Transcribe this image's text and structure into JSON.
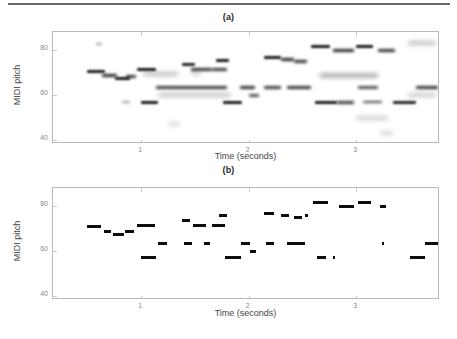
{
  "figure": {
    "background_color": "#ffffff",
    "rule_color": "#6b6b6b",
    "axis_color": "#b9b9b9",
    "ink_color": "#0d0d0d"
  },
  "panels": [
    {
      "id": "panel-a",
      "title": "(a)",
      "xlabel": "Time (seconds)",
      "ylabel": "MIDI pitch",
      "xticks": [
        1,
        2,
        3
      ],
      "xtick_labels": [
        "1",
        "2",
        "3"
      ],
      "yticks": [
        40,
        60,
        80
      ],
      "ytick_labels": [
        "40",
        "60",
        "80"
      ]
    },
    {
      "id": "panel-b",
      "title": "(b)",
      "xlabel": "Time (seconds)",
      "ylabel": "MIDI pitch",
      "xticks": [
        1,
        2,
        3
      ],
      "xtick_labels": [
        "1",
        "2",
        "3"
      ],
      "yticks": [
        40,
        60,
        80
      ],
      "ytick_labels": [
        "40",
        "60",
        "80"
      ]
    }
  ],
  "chart_data": [
    {
      "type": "heatmap",
      "id": "panel-a",
      "title": "(a)",
      "xlabel": "Time (seconds)",
      "ylabel": "MIDI pitch",
      "xlim": [
        0.18,
        3.78
      ],
      "ylim": [
        38.0,
        88.0
      ],
      "xticks": [
        1,
        2,
        3
      ],
      "yticks": [
        40,
        60,
        80
      ],
      "grid": false,
      "legend": "none",
      "description": "Blurred pitch-salience representation: smeared horizontal energy traces at the note pitches of panel (b), with faint partials and spurious low-level energy.",
      "traces": [
        {
          "t0": 0.5,
          "t1": 0.66,
          "pitch": 70.6,
          "strength": 0.95,
          "blur": 1
        },
        {
          "t0": 0.64,
          "t1": 0.78,
          "pitch": 68.6,
          "strength": 0.9,
          "blur": 2
        },
        {
          "t0": 0.76,
          "t1": 0.9,
          "pitch": 67.4,
          "strength": 0.95,
          "blur": 1
        },
        {
          "t0": 0.86,
          "t1": 0.95,
          "pitch": 68.4,
          "strength": 0.85,
          "blur": 2
        },
        {
          "t0": 0.96,
          "t1": 1.14,
          "pitch": 71.4,
          "strength": 0.95,
          "blur": 1
        },
        {
          "t0": 1.02,
          "t1": 1.34,
          "pitch": 69.3,
          "strength": 0.45,
          "blur": 3
        },
        {
          "t0": 1.14,
          "t1": 1.8,
          "pitch": 63.4,
          "strength": 0.8,
          "blur": 2
        },
        {
          "t0": 1.16,
          "t1": 1.84,
          "pitch": 59.9,
          "strength": 0.4,
          "blur": 3
        },
        {
          "t0": 1.0,
          "t1": 1.16,
          "pitch": 56.8,
          "strength": 0.95,
          "blur": 1
        },
        {
          "t0": 1.38,
          "t1": 1.5,
          "pitch": 73.5,
          "strength": 0.9,
          "blur": 1
        },
        {
          "t0": 1.46,
          "t1": 1.66,
          "pitch": 71.3,
          "strength": 0.85,
          "blur": 2
        },
        {
          "t0": 1.7,
          "t1": 1.82,
          "pitch": 75.6,
          "strength": 0.95,
          "blur": 1
        },
        {
          "t0": 1.66,
          "t1": 1.8,
          "pitch": 71.3,
          "strength": 0.8,
          "blur": 2
        },
        {
          "t0": 1.76,
          "t1": 1.94,
          "pitch": 56.8,
          "strength": 0.95,
          "blur": 1
        },
        {
          "t0": 1.92,
          "t1": 2.06,
          "pitch": 63.4,
          "strength": 0.85,
          "blur": 2
        },
        {
          "t0": 2.0,
          "t1": 2.1,
          "pitch": 59.8,
          "strength": 0.7,
          "blur": 2
        },
        {
          "t0": 2.14,
          "t1": 2.3,
          "pitch": 76.8,
          "strength": 0.95,
          "blur": 1
        },
        {
          "t0": 2.14,
          "t1": 2.3,
          "pitch": 63.4,
          "strength": 0.8,
          "blur": 2
        },
        {
          "t0": 2.3,
          "t1": 2.42,
          "pitch": 75.8,
          "strength": 0.9,
          "blur": 2
        },
        {
          "t0": 2.36,
          "t1": 2.58,
          "pitch": 63.4,
          "strength": 0.85,
          "blur": 2
        },
        {
          "t0": 2.42,
          "t1": 2.54,
          "pitch": 75.0,
          "strength": 0.85,
          "blur": 2
        },
        {
          "t0": 2.58,
          "t1": 2.76,
          "pitch": 81.6,
          "strength": 0.95,
          "blur": 1
        },
        {
          "t0": 2.62,
          "t1": 2.82,
          "pitch": 56.8,
          "strength": 0.95,
          "blur": 1
        },
        {
          "t0": 2.66,
          "t1": 3.2,
          "pitch": 68.6,
          "strength": 0.45,
          "blur": 3
        },
        {
          "t0": 2.78,
          "t1": 2.98,
          "pitch": 79.7,
          "strength": 0.9,
          "blur": 2
        },
        {
          "t0": 2.82,
          "t1": 2.98,
          "pitch": 56.8,
          "strength": 0.8,
          "blur": 2
        },
        {
          "t0": 3.0,
          "t1": 3.16,
          "pitch": 81.6,
          "strength": 0.95,
          "blur": 1
        },
        {
          "t0": 3.02,
          "t1": 3.2,
          "pitch": 63.4,
          "strength": 0.7,
          "blur": 2
        },
        {
          "t0": 3.06,
          "t1": 3.24,
          "pitch": 56.8,
          "strength": 0.75,
          "blur": 2
        },
        {
          "t0": 3.2,
          "t1": 3.36,
          "pitch": 79.7,
          "strength": 0.85,
          "blur": 2
        },
        {
          "t0": 3.34,
          "t1": 3.56,
          "pitch": 56.8,
          "strength": 0.9,
          "blur": 1
        },
        {
          "t0": 3.48,
          "t1": 3.74,
          "pitch": 83.0,
          "strength": 0.45,
          "blur": 3
        },
        {
          "t0": 3.56,
          "t1": 3.76,
          "pitch": 63.4,
          "strength": 0.85,
          "blur": 2
        },
        {
          "t0": 3.48,
          "t1": 3.74,
          "pitch": 59.9,
          "strength": 0.35,
          "blur": 3
        },
        {
          "t0": 3.0,
          "t1": 3.3,
          "pitch": 49.5,
          "strength": 0.25,
          "blur": 3
        },
        {
          "t0": 0.58,
          "t1": 0.64,
          "pitch": 82.5,
          "strength": 0.3,
          "blur": 2
        },
        {
          "t0": 0.82,
          "t1": 0.9,
          "pitch": 56.6,
          "strength": 0.3,
          "blur": 2
        },
        {
          "t0": 1.46,
          "t1": 1.56,
          "pitch": 69.5,
          "strength": 0.3,
          "blur": 3
        },
        {
          "t0": 3.22,
          "t1": 3.34,
          "pitch": 43.0,
          "strength": 0.2,
          "blur": 3
        },
        {
          "t0": 1.26,
          "t1": 1.36,
          "pitch": 47.0,
          "strength": 0.18,
          "blur": 3
        }
      ]
    },
    {
      "type": "scatter",
      "id": "panel-b",
      "title": "(b)",
      "xlabel": "Time (seconds)",
      "ylabel": "MIDI pitch",
      "xlim": [
        0.18,
        3.78
      ],
      "ylim": [
        38.0,
        88.0
      ],
      "xticks": [
        1,
        2,
        3
      ],
      "yticks": [
        40,
        60,
        80
      ],
      "grid": false,
      "legend": "none",
      "description": "Quantized note transcription: discrete horizontal note segments (onset time, offset time, MIDI pitch).",
      "notes": [
        {
          "t0": 0.5,
          "t1": 0.63,
          "pitch": 70.6
        },
        {
          "t0": 0.65,
          "t1": 0.72,
          "pitch": 68.7
        },
        {
          "t0": 0.74,
          "t1": 0.84,
          "pitch": 67.4
        },
        {
          "t0": 0.85,
          "t1": 0.93,
          "pitch": 68.4
        },
        {
          "t0": 0.96,
          "t1": 1.13,
          "pitch": 71.3
        },
        {
          "t0": 1.0,
          "t1": 1.14,
          "pitch": 56.8
        },
        {
          "t0": 1.16,
          "t1": 1.24,
          "pitch": 63.4
        },
        {
          "t0": 1.38,
          "t1": 1.45,
          "pitch": 73.5
        },
        {
          "t0": 1.4,
          "t1": 1.47,
          "pitch": 63.4
        },
        {
          "t0": 1.48,
          "t1": 1.6,
          "pitch": 71.3
        },
        {
          "t0": 1.58,
          "t1": 1.64,
          "pitch": 63.4
        },
        {
          "t0": 1.66,
          "t1": 1.78,
          "pitch": 71.3
        },
        {
          "t0": 1.72,
          "t1": 1.8,
          "pitch": 75.6
        },
        {
          "t0": 1.78,
          "t1": 1.93,
          "pitch": 56.8
        },
        {
          "t0": 1.93,
          "t1": 2.01,
          "pitch": 63.4
        },
        {
          "t0": 2.01,
          "t1": 2.07,
          "pitch": 59.8
        },
        {
          "t0": 2.14,
          "t1": 2.24,
          "pitch": 76.8
        },
        {
          "t0": 2.16,
          "t1": 2.24,
          "pitch": 63.4
        },
        {
          "t0": 2.3,
          "t1": 2.38,
          "pitch": 75.8
        },
        {
          "t0": 2.36,
          "t1": 2.52,
          "pitch": 63.4
        },
        {
          "t0": 2.42,
          "t1": 2.5,
          "pitch": 75.0
        },
        {
          "t0": 2.52,
          "t1": 2.55,
          "pitch": 75.6
        },
        {
          "t0": 2.6,
          "t1": 2.74,
          "pitch": 81.6
        },
        {
          "t0": 2.64,
          "t1": 2.72,
          "pitch": 56.8
        },
        {
          "t0": 2.78,
          "t1": 2.8,
          "pitch": 56.8
        },
        {
          "t0": 2.84,
          "t1": 2.98,
          "pitch": 79.7
        },
        {
          "t0": 3.02,
          "t1": 3.14,
          "pitch": 81.6
        },
        {
          "t0": 3.22,
          "t1": 3.28,
          "pitch": 79.7
        },
        {
          "t0": 3.24,
          "t1": 3.26,
          "pitch": 63.4
        },
        {
          "t0": 3.5,
          "t1": 3.64,
          "pitch": 56.8
        },
        {
          "t0": 3.64,
          "t1": 3.76,
          "pitch": 63.4
        }
      ]
    }
  ]
}
